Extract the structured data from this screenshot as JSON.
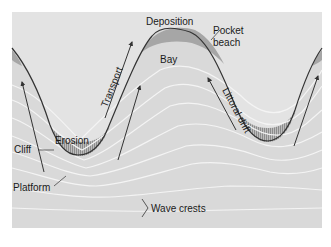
{
  "diagram": {
    "type": "coastline erosion and deposition",
    "labels": {
      "deposition": "Deposition",
      "pocket_beach_line1": "Pocket",
      "pocket_beach_line2": "beach",
      "bay": "Bay",
      "transport": "Transport",
      "littoral_drift": "Littoral drift",
      "erosion": "Erosion",
      "cliff": "Cliff",
      "platform": "Platform",
      "wave_crests": "Wave crests"
    },
    "colors": {
      "background": "#d9d9d9",
      "land": "#e6e6e6",
      "beach": "#a8a8a8",
      "coastline": "#333333",
      "wave_crest": "#f4f4f4",
      "erosion_hatch": "#8c8c8c",
      "arrow": "#333333"
    }
  }
}
